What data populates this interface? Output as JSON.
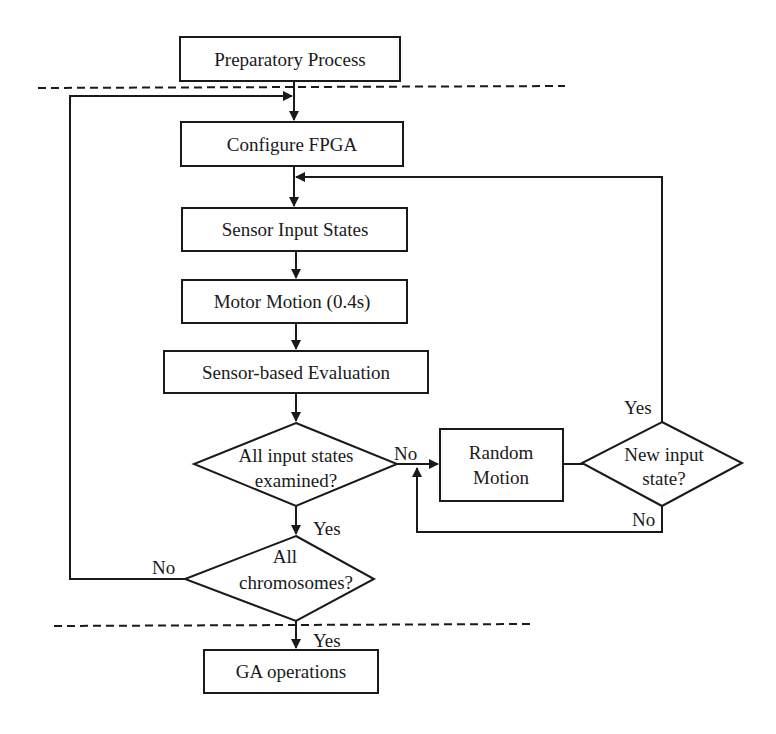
{
  "diagram": {
    "type": "flowchart",
    "nodes": {
      "preparatory": {
        "label": "Preparatory Process",
        "shape": "rect"
      },
      "configure": {
        "label": "Configure FPGA",
        "shape": "rect"
      },
      "sensor_input": {
        "label": "Sensor Input States",
        "shape": "rect"
      },
      "motor_motion": {
        "label": "Motor Motion  (0.4s)",
        "shape": "rect"
      },
      "evaluation": {
        "label": "Sensor-based Evaluation",
        "shape": "rect"
      },
      "all_input": {
        "line1": "All input states",
        "line2": "examined?",
        "shape": "diamond"
      },
      "random_motion": {
        "line1": "Random",
        "line2": "Motion",
        "shape": "rect"
      },
      "new_input": {
        "line1": "New input",
        "line2": "state?",
        "shape": "diamond"
      },
      "all_chromosomes": {
        "line1": "All",
        "line2": "chromosomes?",
        "shape": "diamond"
      },
      "ga_operations": {
        "label": "GA operations",
        "shape": "rect"
      }
    },
    "edge_labels": {
      "all_input_no": "No",
      "all_input_yes": "Yes",
      "new_input_yes": "Yes",
      "new_input_no": "No",
      "chromosomes_no": "No",
      "chromosomes_yes": "Yes"
    },
    "edges": [
      {
        "from": "preparatory",
        "to": "configure"
      },
      {
        "from": "configure",
        "to": "sensor_input"
      },
      {
        "from": "sensor_input",
        "to": "motor_motion"
      },
      {
        "from": "motor_motion",
        "to": "evaluation"
      },
      {
        "from": "evaluation",
        "to": "all_input"
      },
      {
        "from": "all_input",
        "to": "random_motion",
        "label": "No"
      },
      {
        "from": "random_motion",
        "to": "new_input"
      },
      {
        "from": "new_input",
        "to": "sensor_input",
        "label": "Yes"
      },
      {
        "from": "new_input",
        "to": "random_motion",
        "label": "No"
      },
      {
        "from": "all_input",
        "to": "all_chromosomes",
        "label": "Yes"
      },
      {
        "from": "all_chromosomes",
        "to": "configure",
        "label": "No"
      },
      {
        "from": "all_chromosomes",
        "to": "ga_operations",
        "label": "Yes"
      }
    ],
    "separators": [
      "dashed line below Preparatory Process",
      "dashed line above GA operations"
    ]
  }
}
